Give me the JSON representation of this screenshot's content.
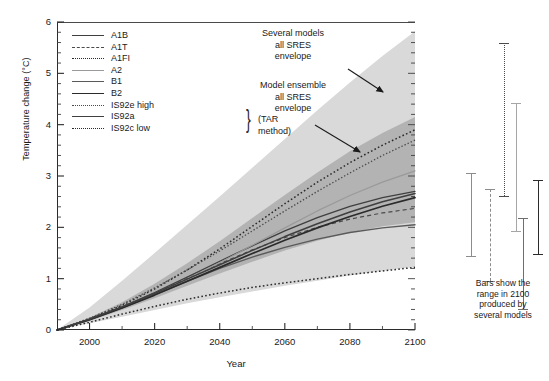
{
  "chart_data": {
    "type": "line",
    "title": "",
    "xlabel": "Year",
    "ylabel": "Temperature change (°C)",
    "xlim": [
      1990,
      2100
    ],
    "ylim": [
      0,
      6
    ],
    "xticks": [
      2000,
      2020,
      2040,
      2060,
      2080,
      2100
    ],
    "yticks": [
      0,
      1,
      2,
      3,
      4,
      5,
      6
    ],
    "grid": false,
    "legend_position": "upper-left",
    "x": [
      1990,
      2000,
      2010,
      2020,
      2030,
      2040,
      2050,
      2060,
      2070,
      2080,
      2090,
      2100
    ],
    "series": [
      {
        "name": "A1B",
        "style": "solid",
        "color": "#3f3f3f",
        "width": 1.3,
        "values": [
          0,
          0.21,
          0.45,
          0.73,
          1.03,
          1.34,
          1.64,
          1.93,
          2.19,
          2.41,
          2.58,
          2.7
        ]
      },
      {
        "name": "A1T",
        "style": "dashed",
        "color": "#4a4a4a",
        "width": 1.2,
        "values": [
          0,
          0.21,
          0.45,
          0.72,
          1.0,
          1.29,
          1.56,
          1.8,
          2.0,
          2.16,
          2.28,
          2.37
        ]
      },
      {
        "name": "A1FI",
        "style": "dotted",
        "color": "#2b2b2b",
        "width": 1.5,
        "values": [
          0,
          0.22,
          0.48,
          0.8,
          1.17,
          1.58,
          2.02,
          2.46,
          2.88,
          3.26,
          3.6,
          3.9
        ]
      },
      {
        "name": "A2",
        "style": "solid",
        "color": "#9a9a9a",
        "width": 1.2,
        "values": [
          0,
          0.2,
          0.43,
          0.69,
          0.99,
          1.31,
          1.65,
          1.99,
          2.32,
          2.62,
          2.88,
          3.1
        ]
      },
      {
        "name": "B1",
        "style": "solid",
        "color": "#5a5a5a",
        "width": 1.4,
        "values": [
          0,
          0.2,
          0.43,
          0.69,
          0.95,
          1.2,
          1.42,
          1.61,
          1.77,
          1.9,
          1.99,
          2.05
        ]
      },
      {
        "name": "B2",
        "style": "solid",
        "color": "#2b2b2b",
        "width": 1.7,
        "values": [
          0,
          0.2,
          0.43,
          0.68,
          0.95,
          1.22,
          1.49,
          1.75,
          1.99,
          2.21,
          2.41,
          2.58
        ]
      },
      {
        "name": "IS92e high",
        "style": "dotted",
        "color": "#4a4a4a",
        "width": 1.3,
        "values": [
          0,
          0.23,
          0.5,
          0.82,
          1.17,
          1.54,
          1.93,
          2.32,
          2.7,
          3.06,
          3.4,
          3.7
        ]
      },
      {
        "name": "IS92a",
        "style": "solid",
        "color": "#3f3f3f",
        "width": 1.5,
        "values": [
          0,
          0.21,
          0.45,
          0.71,
          0.99,
          1.27,
          1.55,
          1.82,
          2.07,
          2.3,
          2.5,
          2.66
        ]
      },
      {
        "name": "IS92c low",
        "style": "dotted",
        "color": "#2b2b2b",
        "width": 1.5,
        "values": [
          0,
          0.15,
          0.31,
          0.46,
          0.6,
          0.72,
          0.83,
          0.92,
          1.0,
          1.08,
          1.15,
          1.22
        ]
      }
    ],
    "bands": [
      {
        "name": "Several models all SRES envelope",
        "color": "#d9d9d9",
        "upper": [
          0,
          0.44,
          0.96,
          1.5,
          2.05,
          2.6,
          3.16,
          3.72,
          4.28,
          4.82,
          5.34,
          5.82
        ],
        "lower": [
          0,
          0.13,
          0.26,
          0.39,
          0.52,
          0.64,
          0.75,
          0.86,
          0.96,
          1.06,
          1.15,
          1.23
        ]
      },
      {
        "name": "Model ensemble all SRES envelope",
        "color": "#b3b3b3",
        "upper": [
          0,
          0.24,
          0.54,
          0.9,
          1.3,
          1.73,
          2.18,
          2.63,
          3.07,
          3.48,
          3.84,
          4.15
        ],
        "lower": [
          0,
          0.18,
          0.39,
          0.62,
          0.86,
          1.1,
          1.33,
          1.55,
          1.74,
          1.9,
          2.02,
          2.1
        ]
      }
    ],
    "annotations": [
      {
        "id": "several-models-annotation",
        "text": "Several models\nall SRES\nenvelope"
      },
      {
        "id": "model-ensemble-annotation",
        "text": "Model ensemble\nall SRES\nenvelope"
      }
    ],
    "bars_2100": [
      {
        "name": "bar-1",
        "style": "solid",
        "color": "#8c8c8c",
        "width": 1.4,
        "low": 1.45,
        "high": 3.05
      },
      {
        "name": "bar-2",
        "style": "dashed",
        "color": "#8c8c8c",
        "width": 1.4,
        "low": 0.95,
        "high": 2.75
      },
      {
        "name": "bar-3",
        "style": "dotted",
        "color": "#4a4a4a",
        "width": 1.6,
        "low": 2.62,
        "high": 5.6
      },
      {
        "name": "bar-4",
        "style": "solid",
        "color": "#a6a6a6",
        "width": 1.6,
        "low": 1.92,
        "high": 4.42
      },
      {
        "name": "bar-5",
        "style": "solid",
        "color": "#6e6e6e",
        "width": 1.5,
        "low": 0.4,
        "high": 2.18
      },
      {
        "name": "bar-6",
        "style": "solid",
        "color": "#2b2b2b",
        "width": 1.8,
        "low": 1.48,
        "high": 2.92
      }
    ]
  },
  "axes": {
    "y_label": "Temperature change (°C)",
    "x_label": "Year",
    "y_tick_labels": [
      "6",
      "5",
      "4",
      "3",
      "2",
      "1",
      "0"
    ],
    "x_tick_labels": [
      "2000",
      "2020",
      "2040",
      "2060",
      "2080",
      "2100"
    ]
  },
  "legend": {
    "items": [
      {
        "label": "A1B"
      },
      {
        "label": "A1T"
      },
      {
        "label": "A1FI"
      },
      {
        "label": "A2"
      },
      {
        "label": "B1"
      },
      {
        "label": "B2"
      },
      {
        "label": "IS92e high"
      },
      {
        "label": "IS92a"
      },
      {
        "label": "IS92c low"
      }
    ],
    "group_note": "(TAR method)",
    "brace": "}"
  },
  "annotations": {
    "several_models": {
      "line1": "Several models",
      "line2": "all SRES",
      "line3": "envelope"
    },
    "model_ensemble": {
      "line1": "Model ensemble",
      "line2": "all SRES",
      "line3": "envelope"
    }
  },
  "bars_caption": {
    "line1": "Bars show the",
    "line2": "range in 2100",
    "line3": "produced by",
    "line4": "several models"
  }
}
